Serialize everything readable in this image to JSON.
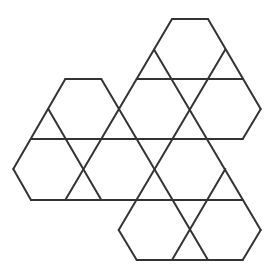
{
  "figure": {
    "stroke_color": "#333333",
    "background": "#ffffff",
    "grid": {
      "x": [
        13.3,
        31,
        48.3,
        65.3,
        83.3,
        101.3,
        118.7,
        136.7,
        154,
        172,
        190,
        208,
        225.3,
        242.7,
        260.7
      ],
      "y": [
        19,
        49.5,
        79,
        109,
        139,
        169,
        200,
        230,
        260
      ]
    },
    "segments": [
      [
        [
          9,
          0
        ],
        [
          11,
          0
        ]
      ],
      [
        [
          3,
          2
        ],
        [
          5,
          2
        ]
      ],
      [
        [
          7,
          2
        ],
        [
          13,
          2
        ]
      ],
      [
        [
          1,
          4
        ],
        [
          13,
          4
        ]
      ],
      [
        [
          1,
          6
        ],
        [
          13,
          6
        ]
      ],
      [
        [
          7,
          8
        ],
        [
          13,
          8
        ]
      ],
      [
        [
          11,
          0
        ],
        [
          14,
          3
        ]
      ],
      [
        [
          8,
          1
        ],
        [
          14,
          7
        ]
      ],
      [
        [
          5,
          2
        ],
        [
          11,
          8
        ]
      ],
      [
        [
          2,
          3
        ],
        [
          5,
          6
        ]
      ],
      [
        [
          0,
          5
        ],
        [
          1,
          6
        ]
      ],
      [
        [
          6,
          7
        ],
        [
          7,
          8
        ]
      ],
      [
        [
          9,
          0
        ],
        [
          3,
          6
        ]
      ],
      [
        [
          3,
          2
        ],
        [
          0,
          5
        ]
      ],
      [
        [
          12,
          1
        ],
        [
          6,
          7
        ]
      ],
      [
        [
          14,
          3
        ],
        [
          13,
          4
        ]
      ],
      [
        [
          12,
          5
        ],
        [
          9,
          8
        ]
      ],
      [
        [
          14,
          7
        ],
        [
          13,
          8
        ]
      ]
    ]
  }
}
